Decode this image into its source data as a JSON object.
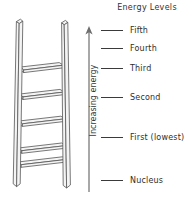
{
  "figure": {
    "title": "Energy Levels",
    "axis": {
      "label": "Increasing energy",
      "direction": "up",
      "arrow_icon": "up-arrow-icon"
    },
    "illustration": {
      "name": "ladder-illustration",
      "description": "Ladder",
      "rung_count": 5
    },
    "levels": [
      {
        "id": "fifth",
        "label": "Fifth",
        "y": 30
      },
      {
        "id": "fourth",
        "label": "Fourth",
        "y": 48
      },
      {
        "id": "third",
        "label": "Third",
        "y": 68
      },
      {
        "id": "second",
        "label": "Second",
        "y": 97
      },
      {
        "id": "first",
        "label": "First (lowest)",
        "y": 137
      },
      {
        "id": "nucleus",
        "label": "Nucleus",
        "y": 180
      }
    ],
    "colors": {
      "background": "#ffffff",
      "ink": "#2e2e2e",
      "line": "#3a3a3a",
      "ladder_stroke": "#555555",
      "ladder_fill": "#f2f2f2"
    }
  }
}
